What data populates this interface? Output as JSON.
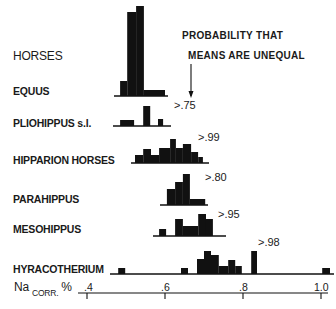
{
  "header": {
    "group_label": "HORSES",
    "annotation_line1": "PROBABILITY THAT",
    "annotation_line2": "MEANS ARE UNEQUAL"
  },
  "axis": {
    "label_main": "Na",
    "label_sub": "CORR.",
    "label_unit": "%",
    "ticks": [
      ".4",
      ".6",
      ".8",
      "1.0"
    ]
  },
  "chart_data": {
    "type": "bar",
    "subtype": "stacked-histograms",
    "xlabel": "Na corr. %",
    "ylabel": "Horses",
    "xlim": [
      0.38,
      1.02
    ],
    "x_ticks": [
      0.4,
      0.6,
      0.8,
      1.0
    ],
    "x_tick_labels": [
      ".4",
      ".6",
      ".8",
      "1.0"
    ],
    "grid": false,
    "legend": null,
    "series": [
      {
        "name": "EQUUS",
        "probability_label": "",
        "bins": [
          {
            "x0": 0.485,
            "x1": 0.503,
            "height": 15
          },
          {
            "x0": 0.503,
            "x1": 0.526,
            "height": 84
          },
          {
            "x0": 0.526,
            "x1": 0.546,
            "height": 90
          },
          {
            "x0": 0.546,
            "x1": 0.6,
            "height": 6
          }
        ]
      },
      {
        "name": "PLIOHIPPUS s.l.",
        "probability_label": ">.75",
        "bins": [
          {
            "x0": 0.485,
            "x1": 0.521,
            "height": 6
          },
          {
            "x0": 0.544,
            "x1": 0.562,
            "height": 20
          },
          {
            "x0": 0.582,
            "x1": 0.595,
            "height": 7
          }
        ]
      },
      {
        "name": "HIPPARION HORSES",
        "probability_label": ">.99",
        "bins": [
          {
            "x0": 0.523,
            "x1": 0.544,
            "height": 8
          },
          {
            "x0": 0.544,
            "x1": 0.564,
            "height": 14
          },
          {
            "x0": 0.564,
            "x1": 0.585,
            "height": 8
          },
          {
            "x0": 0.585,
            "x1": 0.613,
            "height": 15
          },
          {
            "x0": 0.613,
            "x1": 0.628,
            "height": 24
          },
          {
            "x0": 0.628,
            "x1": 0.646,
            "height": 15
          },
          {
            "x0": 0.646,
            "x1": 0.667,
            "height": 19
          },
          {
            "x0": 0.667,
            "x1": 0.685,
            "height": 11
          },
          {
            "x0": 0.685,
            "x1": 0.697,
            "height": 6
          }
        ]
      },
      {
        "name": "PARAHIPPUS",
        "probability_label": ">.80",
        "bins": [
          {
            "x0": 0.605,
            "x1": 0.626,
            "height": 16
          },
          {
            "x0": 0.626,
            "x1": 0.646,
            "height": 23
          },
          {
            "x0": 0.646,
            "x1": 0.664,
            "height": 31
          },
          {
            "x0": 0.664,
            "x1": 0.703,
            "height": 6
          }
        ]
      },
      {
        "name": "MESOHIPPUS",
        "probability_label": ">.95",
        "bins": [
          {
            "x0": 0.585,
            "x1": 0.603,
            "height": 7
          },
          {
            "x0": 0.626,
            "x1": 0.646,
            "height": 17
          },
          {
            "x0": 0.646,
            "x1": 0.685,
            "height": 10
          },
          {
            "x0": 0.685,
            "x1": 0.705,
            "height": 22
          },
          {
            "x0": 0.705,
            "x1": 0.723,
            "height": 17
          }
        ]
      },
      {
        "name": "HYRACOTHERIUM",
        "probability_label": ">.98",
        "bins": [
          {
            "x0": 0.48,
            "x1": 0.498,
            "height": 6
          },
          {
            "x0": 0.641,
            "x1": 0.659,
            "height": 6
          },
          {
            "x0": 0.682,
            "x1": 0.7,
            "height": 15
          },
          {
            "x0": 0.7,
            "x1": 0.718,
            "height": 23
          },
          {
            "x0": 0.718,
            "x1": 0.738,
            "height": 19
          },
          {
            "x0": 0.738,
            "x1": 0.762,
            "height": 8
          },
          {
            "x0": 0.762,
            "x1": 0.78,
            "height": 14
          },
          {
            "x0": 0.78,
            "x1": 0.797,
            "height": 8
          },
          {
            "x0": 0.821,
            "x1": 0.836,
            "height": 23
          },
          {
            "x0": 0.1003,
            "x1": 0.1003,
            "height": 0
          },
          {
            "x0": 1.003,
            "x1": 1.023,
            "height": 6
          }
        ]
      }
    ]
  },
  "colors": {
    "ink": "#111111",
    "background": "#ffffff"
  }
}
